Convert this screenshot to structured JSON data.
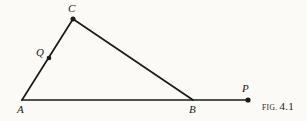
{
  "figure": {
    "caption_prefix": "FIG.",
    "caption_number": "4.1",
    "background_color": "#fbfaf6",
    "ink_color": "#1a1a1a",
    "width": 307,
    "height": 121
  },
  "geometry": {
    "points": [
      {
        "id": "A",
        "label": "A",
        "x": 22,
        "y": 100,
        "marker": false,
        "label_x": 17,
        "label_y": 104
      },
      {
        "id": "B",
        "label": "B",
        "x": 193,
        "y": 100,
        "marker": false,
        "label_x": 189,
        "label_y": 104
      },
      {
        "id": "C",
        "label": "C",
        "x": 73,
        "y": 19,
        "marker": true,
        "label_x": 68,
        "label_y": 4
      },
      {
        "id": "Q",
        "label": "Q",
        "x": 49,
        "y": 58,
        "marker": true,
        "label_x": 37,
        "label_y": 48
      },
      {
        "id": "P",
        "label": "P",
        "x": 248,
        "y": 100,
        "marker": true,
        "label_x": 243,
        "label_y": 84
      }
    ],
    "segments": [
      {
        "id": "AP",
        "from": "A",
        "to": "P",
        "description": "base-line-A-through-B-to-P"
      },
      {
        "id": "AC",
        "from": "A",
        "to": "C",
        "description": "left-side-A-to-C-through-Q"
      },
      {
        "id": "CB",
        "from": "C",
        "to": "B",
        "description": "right-side-C-to-B"
      }
    ],
    "marker_radius": 2.4,
    "stroke_width": 1.6
  }
}
